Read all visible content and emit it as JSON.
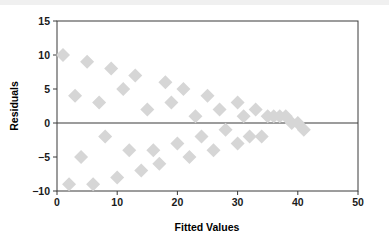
{
  "chart_data": {
    "type": "scatter",
    "title": "",
    "xlabel": "Fitted Values",
    "ylabel": "Residuals",
    "xlim": [
      0,
      50
    ],
    "ylim": [
      -10,
      15
    ],
    "xticks": [
      0,
      10,
      20,
      30,
      40,
      50
    ],
    "yticks": [
      -10,
      -5,
      0,
      5,
      10,
      15
    ],
    "xtick_labels": [
      "0",
      "10",
      "20",
      "30",
      "40",
      "50"
    ],
    "ytick_labels": [
      "−10",
      "−5",
      "0",
      "5",
      "10",
      "15"
    ],
    "grid": false,
    "legend": null,
    "marker": {
      "shape": "diamond",
      "color": "#d6d6d6",
      "size": 7
    },
    "reference_lines": [
      {
        "axis": "y",
        "value": 0,
        "color": "#3a3a3a"
      }
    ],
    "series": [
      {
        "name": "Residuals",
        "points": [
          [
            1,
            10
          ],
          [
            2,
            -9
          ],
          [
            3,
            4
          ],
          [
            5,
            9
          ],
          [
            4,
            -5
          ],
          [
            6,
            -9
          ],
          [
            7,
            3
          ],
          [
            9,
            8
          ],
          [
            8,
            -2
          ],
          [
            10,
            -8
          ],
          [
            11,
            5
          ],
          [
            13,
            7
          ],
          [
            12,
            -4
          ],
          [
            14,
            -7
          ],
          [
            15,
            2
          ],
          [
            18,
            6
          ],
          [
            16,
            -4
          ],
          [
            17,
            -6
          ],
          [
            19,
            3
          ],
          [
            21,
            5
          ],
          [
            20,
            -3
          ],
          [
            22,
            -5
          ],
          [
            23,
            1
          ],
          [
            25,
            4
          ],
          [
            24,
            -2
          ],
          [
            26,
            -4
          ],
          [
            27,
            2
          ],
          [
            30,
            3
          ],
          [
            28,
            -1
          ],
          [
            30,
            -3
          ],
          [
            31,
            1
          ],
          [
            33,
            2
          ],
          [
            32,
            -2
          ],
          [
            34,
            -2
          ],
          [
            35,
            1
          ],
          [
            36,
            1
          ],
          [
            37,
            1
          ],
          [
            38,
            1
          ],
          [
            39,
            0
          ],
          [
            40,
            0
          ],
          [
            41,
            -1
          ]
        ]
      }
    ]
  }
}
